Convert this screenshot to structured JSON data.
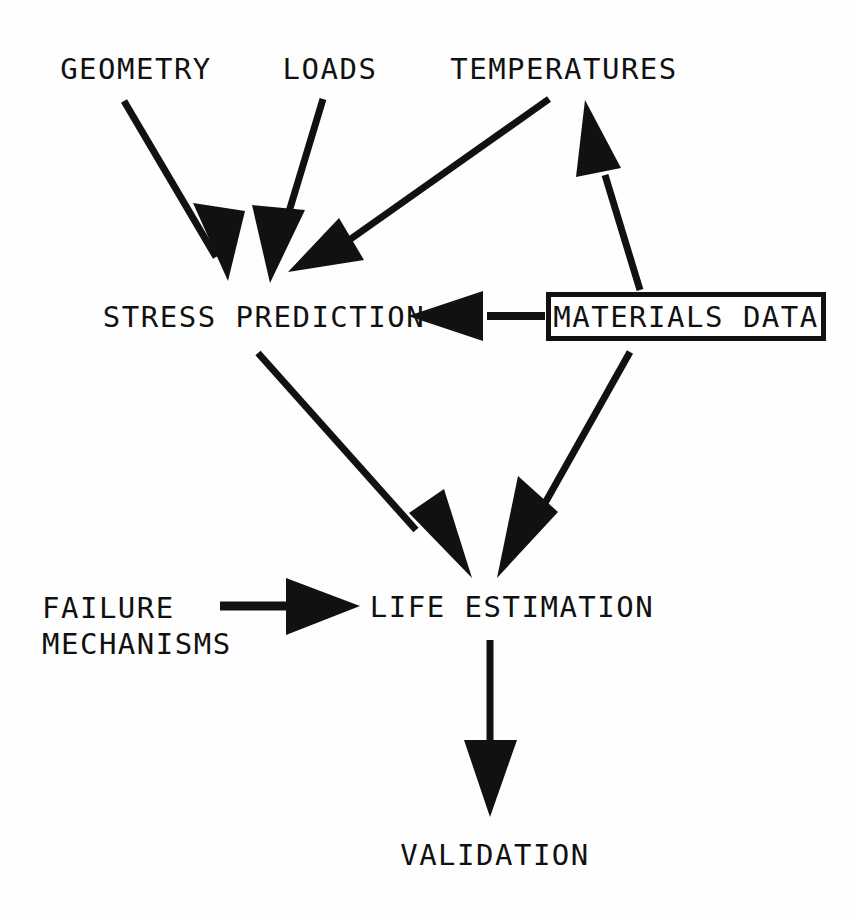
{
  "diagram": {
    "background_color": "#ffffff",
    "ink_color": "#111111",
    "nodes": [
      {
        "id": "geometry",
        "label": "GEOMETRY",
        "boxed": false
      },
      {
        "id": "loads",
        "label": "LOADS",
        "boxed": false
      },
      {
        "id": "temperatures",
        "label": "TEMPERATURES",
        "boxed": false
      },
      {
        "id": "stress",
        "label": "STRESS PREDICTION",
        "boxed": false
      },
      {
        "id": "materials",
        "label": "MATERIALS DATA",
        "boxed": true
      },
      {
        "id": "failure_line1",
        "label": "FAILURE",
        "boxed": false
      },
      {
        "id": "failure_line2",
        "label": "MECHANISMS",
        "boxed": false
      },
      {
        "id": "life",
        "label": "LIFE ESTIMATION",
        "boxed": false
      },
      {
        "id": "validation",
        "label": "VALIDATION",
        "boxed": false
      }
    ],
    "edges": [
      {
        "id": "geometry-to-stress",
        "from": "geometry",
        "to": "stress",
        "arrowhead": "filled-triangle"
      },
      {
        "id": "loads-to-stress",
        "from": "loads",
        "to": "stress",
        "arrowhead": "filled-triangle"
      },
      {
        "id": "temperatures-to-stress",
        "from": "temperatures",
        "to": "stress",
        "arrowhead": "filled-triangle"
      },
      {
        "id": "materials-to-temperatures",
        "from": "materials",
        "to": "temperatures",
        "arrowhead": "filled-triangle"
      },
      {
        "id": "materials-to-stress",
        "from": "materials",
        "to": "stress",
        "arrowhead": "filled-triangle"
      },
      {
        "id": "stress-to-life",
        "from": "stress",
        "to": "life",
        "arrowhead": "filled-triangle"
      },
      {
        "id": "materials-to-life",
        "from": "materials",
        "to": "life",
        "arrowhead": "filled-triangle"
      },
      {
        "id": "failure-to-life",
        "from": "failure_line1",
        "to": "life",
        "arrowhead": "filled-triangle"
      },
      {
        "id": "life-to-validation",
        "from": "life",
        "to": "validation",
        "arrowhead": "filled-triangle"
      }
    ]
  }
}
